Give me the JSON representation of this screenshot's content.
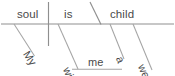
{
  "diagram": {
    "type": "reed-kellogg-sentence-diagram",
    "sentence": "My soul is within me a weaned child.",
    "ink_color": "#8f8f8f",
    "text_color": "#4a4a4a",
    "background": "#ffffff",
    "baseline": {
      "subject": "soul",
      "verb": "is",
      "predicate_nominative": "child"
    },
    "modifiers": {
      "subject_modifier": "My",
      "preposition": "within",
      "prep_object": "me",
      "article": "a",
      "adjective": "weaned"
    }
  },
  "words": {
    "my": "My",
    "soul": "soul",
    "is": "is",
    "within": "within",
    "me": "me",
    "a": "a",
    "weaned": "weaned",
    "child": "child"
  }
}
